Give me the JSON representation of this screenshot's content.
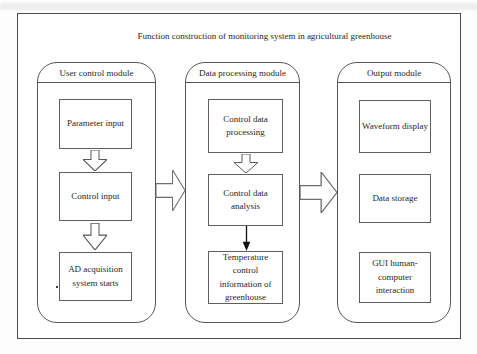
{
  "title": "Function construction of monitoring system in agricultural greenhouse",
  "modules": [
    {
      "name": "User control module",
      "boxes": [
        "Parameter input",
        "Control input",
        "AD acquisition system starts"
      ]
    },
    {
      "name": "Data processing module",
      "boxes": [
        "Control data processing",
        "Control data analysis",
        "Temperature control information of greenhouse"
      ]
    },
    {
      "name": "Output module",
      "boxes": [
        "Waveform display",
        "Data storage",
        "GUI human-computer interaction"
      ]
    }
  ],
  "arrows": {
    "parameter_to_control": "hollow-down-block-arrow",
    "control_to_ad_acquisition": "hollow-down-block-arrow",
    "processing_to_analysis": "hollow-down-block-arrow",
    "analysis_to_temperature_info": "solid-down-arrow",
    "user_module_to_processing_module": "hollow-right-block-arrow",
    "processing_module_to_output_module": "hollow-right-block-arrow"
  },
  "colors": {
    "line": "#565656",
    "text": "#1f1f1f",
    "background": "#ffffff"
  }
}
